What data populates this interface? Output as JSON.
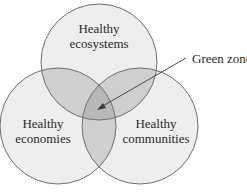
{
  "diagram": {
    "type": "venn",
    "sets": [
      {
        "id": "ecosystems",
        "line1": "Healthy",
        "line2": "ecosystems"
      },
      {
        "id": "economies",
        "line1": "Healthy",
        "line2": "economies"
      },
      {
        "id": "communities",
        "line1": "Healthy",
        "line2": "communities"
      }
    ],
    "annotation": {
      "label": "Green zone",
      "points_to": "intersection of all three sets"
    },
    "colors": {
      "single_region": "#eeeeee",
      "double_overlap": "#cfcfcf",
      "triple_overlap": "#b8b8b8",
      "outline": "#6e6e6e",
      "text": "#2a2a2a"
    }
  }
}
